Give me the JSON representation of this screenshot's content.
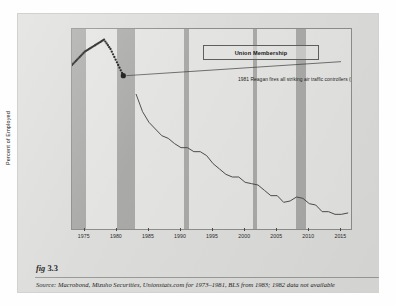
{
  "figure": {
    "label_prefix": "fig",
    "label_number": "3.3",
    "source": "Source:  Macrobond, Mizuho Securities, Unionstats.com for 1973–1981, BLS from 1983; 1982 data not available"
  },
  "legend": {
    "label": "Union Membership"
  },
  "annotation": {
    "text": "1981 Reagan fires all striking air traffic controllers (PATCO)"
  },
  "colors": {
    "page": "#ffffff",
    "card": "#dcdcda",
    "plot_background": "#e3e3e1",
    "recession_band": "#a9a9a7",
    "line": "#4c4c4a",
    "dots": "#151515",
    "axis": "#4a4a48",
    "text": "#222222"
  },
  "chart_data": {
    "type": "line",
    "title": "Union Membership",
    "xlabel": "",
    "ylabel": "Percent of Employed",
    "xlim": [
      1973,
      2016.5
    ],
    "ylim": [
      10.0,
      25.0
    ],
    "grid": false,
    "legend_position": "top-center",
    "yticks": [
      "25.0",
      "22.5",
      "20.0",
      "17.5",
      "15.0",
      "12.5",
      "10.0"
    ],
    "ytick_values": [
      25.0,
      22.5,
      20.0,
      17.5,
      15.0,
      12.5,
      10.0
    ],
    "xticks": [
      "1975",
      "1980",
      "1985",
      "1990",
      "1995",
      "2000",
      "2005",
      "2010",
      "2015"
    ],
    "xtick_values": [
      1975,
      1980,
      1985,
      1990,
      1995,
      2000,
      2005,
      2010,
      2015
    ],
    "series": [
      {
        "name": "Union Membership (1973–1981, Unionstats.com)",
        "style": "dotted-markers",
        "x": [
          1973,
          1974,
          1975,
          1976,
          1977,
          1978,
          1979,
          1980,
          1981
        ],
        "values": [
          22.3,
          22.8,
          23.3,
          23.6,
          23.9,
          24.2,
          23.5,
          22.5,
          21.5
        ]
      },
      {
        "name": "Union Membership (1983–2016, BLS)",
        "style": "solid-line",
        "x": [
          1983,
          1984,
          1985,
          1986,
          1987,
          1988,
          1989,
          1990,
          1991,
          1992,
          1993,
          1994,
          1995,
          1996,
          1997,
          1998,
          1999,
          2000,
          2001,
          2002,
          2003,
          2004,
          2005,
          2006,
          2007,
          2008,
          2009,
          2010,
          2011,
          2012,
          2013,
          2014,
          2015,
          2016
        ],
        "values": [
          20.1,
          18.8,
          18.0,
          17.5,
          17.0,
          16.8,
          16.4,
          16.1,
          16.1,
          15.8,
          15.8,
          15.5,
          14.9,
          14.5,
          14.1,
          13.9,
          13.9,
          13.5,
          13.4,
          13.3,
          12.9,
          12.5,
          12.5,
          12.0,
          12.1,
          12.4,
          12.3,
          11.9,
          11.8,
          11.3,
          11.3,
          11.1,
          11.1,
          11.2
        ]
      }
    ],
    "markers": [
      {
        "name": "patco-marker",
        "x": 1981,
        "y": 21.5
      }
    ],
    "shaded_regions": [
      {
        "name": "recession-1973-1975",
        "x0": 1973.0,
        "x1": 1975.25
      },
      {
        "name": "recession-1980-1982",
        "x0": 1980.0,
        "x1": 1982.9
      },
      {
        "name": "recession-1990-1991",
        "x0": 1990.5,
        "x1": 1991.3
      },
      {
        "name": "recession-2001",
        "x0": 2001.2,
        "x1": 2001.9
      },
      {
        "name": "recession-2008-2009",
        "x0": 2007.9,
        "x1": 2009.5
      }
    ],
    "annotations": [
      {
        "name": "patco-annotation",
        "text": "1981 Reagan fires all striking air traffic controllers (PATCO)",
        "x": 1981,
        "y": 21.5
      }
    ]
  }
}
